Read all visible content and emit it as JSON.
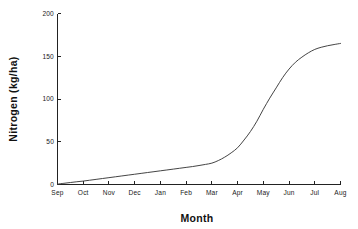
{
  "chart_data": {
    "type": "line",
    "title": "",
    "xlabel": "Month",
    "ylabel": "Nitrogen (kg/ha)",
    "xlim": [
      0,
      11
    ],
    "ylim": [
      0,
      200
    ],
    "grid": false,
    "legend": "none",
    "x_tick_labels": [
      "Sep",
      "Oct",
      "Nov",
      "Dec",
      "Jan",
      "Feb",
      "Mar",
      "Apr",
      "May",
      "Jun",
      "Jul",
      "Aug"
    ],
    "y_tick_labels": [
      "0",
      "50",
      "100",
      "150",
      "200"
    ],
    "y_tick_values": [
      0,
      50,
      100,
      150,
      200
    ],
    "categories": [
      "Sep",
      "Oct",
      "Nov",
      "Dec",
      "Jan",
      "Feb",
      "Mar",
      "Apr",
      "May",
      "Jun",
      "Jul",
      "Aug"
    ],
    "values": [
      1,
      4,
      8,
      12,
      16,
      20,
      25,
      43,
      88,
      135,
      158,
      165
    ],
    "series": [
      {
        "name": "Nitrogen uptake",
        "color": "#3a3a3a",
        "values": [
          1,
          4,
          8,
          12,
          16,
          20,
          25,
          43,
          88,
          135,
          158,
          165
        ]
      }
    ],
    "dense_points": [
      [
        0.0,
        0.5
      ],
      [
        0.25,
        1.4
      ],
      [
        0.5,
        2.3
      ],
      [
        0.75,
        3.2
      ],
      [
        1.0,
        4.0
      ],
      [
        1.25,
        5.0
      ],
      [
        1.5,
        6.0
      ],
      [
        1.75,
        7.0
      ],
      [
        2.0,
        8.0
      ],
      [
        2.25,
        9.0
      ],
      [
        2.5,
        10.0
      ],
      [
        2.75,
        11.0
      ],
      [
        3.0,
        12.0
      ],
      [
        3.25,
        13.0
      ],
      [
        3.5,
        14.0
      ],
      [
        3.75,
        15.0
      ],
      [
        4.0,
        16.0
      ],
      [
        4.25,
        17.0
      ],
      [
        4.5,
        18.0
      ],
      [
        4.75,
        19.0
      ],
      [
        5.0,
        20.0
      ],
      [
        5.25,
        21.0
      ],
      [
        5.5,
        22.2
      ],
      [
        5.75,
        23.5
      ],
      [
        6.0,
        25.0
      ],
      [
        6.25,
        28.0
      ],
      [
        6.5,
        32.0
      ],
      [
        6.75,
        37.0
      ],
      [
        7.0,
        43.0
      ],
      [
        7.25,
        52.0
      ],
      [
        7.5,
        62.0
      ],
      [
        7.75,
        74.0
      ],
      [
        8.0,
        88.0
      ],
      [
        8.25,
        101.0
      ],
      [
        8.5,
        113.0
      ],
      [
        8.75,
        125.0
      ],
      [
        9.0,
        135.0
      ],
      [
        9.25,
        143.0
      ],
      [
        9.5,
        149.0
      ],
      [
        9.75,
        154.0
      ],
      [
        10.0,
        158.0
      ],
      [
        10.25,
        160.5
      ],
      [
        10.5,
        162.3
      ],
      [
        10.75,
        163.7
      ],
      [
        11.0,
        165.0
      ]
    ]
  }
}
